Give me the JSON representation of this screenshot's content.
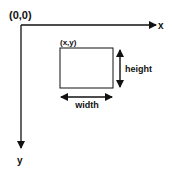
{
  "diagram": {
    "origin_label": "(0,0)",
    "x_axis_label": "x",
    "y_axis_label": "y",
    "rect_corner_label": "(x,y)",
    "width_label": "width",
    "height_label": "height",
    "colors": {
      "stroke": "#111111",
      "background": "#ffffff"
    }
  }
}
